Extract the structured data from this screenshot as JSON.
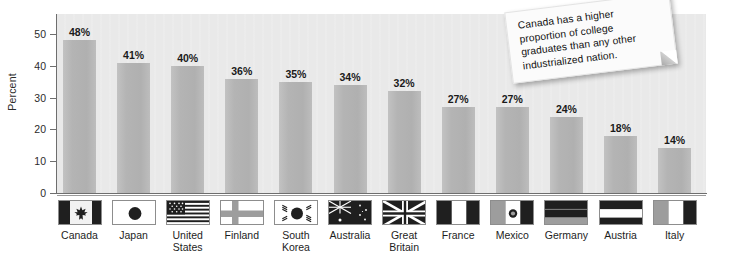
{
  "chart_data": {
    "type": "bar",
    "title": "",
    "xlabel": "",
    "ylabel": "Percent",
    "ylim": [
      0,
      50
    ],
    "yticks": [
      0,
      10,
      20,
      30,
      40,
      50
    ],
    "ytick_labels": [
      "0",
      "10",
      "20",
      "30",
      "40",
      "50"
    ],
    "grid": false,
    "legend": "none",
    "categories": [
      "Canada",
      "Japan",
      "United States",
      "Finland",
      "South Korea",
      "Australia",
      "Great Britain",
      "France",
      "Mexico",
      "Germany",
      "Austria",
      "Italy"
    ],
    "values": [
      48,
      41,
      40,
      36,
      35,
      34,
      32,
      27,
      27,
      24,
      18,
      14
    ],
    "data_labels": [
      "48%",
      "41%",
      "40%",
      "36%",
      "35%",
      "34%",
      "32%",
      "27%",
      "27%",
      "24%",
      "18%",
      "14%"
    ],
    "annotations": [
      "Canada has a higher proportion of college graduates than any other industrialized nation."
    ]
  },
  "axis": {
    "y_title": "Percent"
  },
  "callout": {
    "text": "Canada has a higher proportion of college graduates than any other industrialized nation."
  },
  "countries": [
    {
      "label_line1": "Canada",
      "label_line2": "",
      "flag_icon": "flag-canada"
    },
    {
      "label_line1": "Japan",
      "label_line2": "",
      "flag_icon": "flag-japan"
    },
    {
      "label_line1": "United",
      "label_line2": "States",
      "flag_icon": "flag-united-states"
    },
    {
      "label_line1": "Finland",
      "label_line2": "",
      "flag_icon": "flag-finland"
    },
    {
      "label_line1": "South",
      "label_line2": "Korea",
      "flag_icon": "flag-south-korea"
    },
    {
      "label_line1": "Australia",
      "label_line2": "",
      "flag_icon": "flag-australia"
    },
    {
      "label_line1": "Great",
      "label_line2": "Britain",
      "flag_icon": "flag-great-britain"
    },
    {
      "label_line1": "France",
      "label_line2": "",
      "flag_icon": "flag-france"
    },
    {
      "label_line1": "Mexico",
      "label_line2": "",
      "flag_icon": "flag-mexico"
    },
    {
      "label_line1": "Germany",
      "label_line2": "",
      "flag_icon": "flag-germany"
    },
    {
      "label_line1": "Austria",
      "label_line2": "",
      "flag_icon": "flag-austria"
    },
    {
      "label_line1": "Italy",
      "label_line2": "",
      "flag_icon": "flag-italy"
    }
  ],
  "colors": {
    "bar_fill": "#b4b4b4",
    "plot_background": "#e9e9e9",
    "page_background": "#ffffff",
    "axis_line": "#6e6e6e",
    "text": "#1a1a1a",
    "note_background": "#fbfbfb"
  }
}
